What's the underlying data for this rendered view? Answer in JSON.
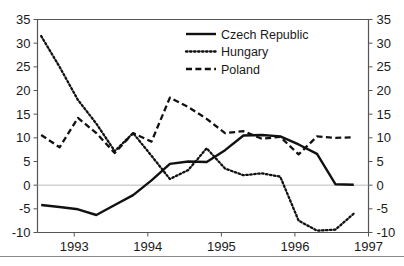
{
  "chart_data": {
    "type": "line",
    "title": "",
    "subtitle": "",
    "xlabel": "",
    "ylabel": "",
    "xlim": [
      1992.5,
      1997.0
    ],
    "ylim": [
      -10,
      35
    ],
    "yticks": [
      -10,
      -5,
      0,
      5,
      10,
      15,
      20,
      25,
      30,
      35
    ],
    "ytick_labels": [
      "-10",
      "-5",
      "0",
      "5",
      "10",
      "15",
      "20",
      "25",
      "30",
      "35"
    ],
    "xticks": [
      1993,
      1994,
      1995,
      1996,
      1997
    ],
    "xtick_labels": [
      "1993",
      "1994",
      "1995",
      "1996",
      "1997"
    ],
    "right_axis": true,
    "right_ytick_labels": [
      "-10",
      "-5",
      "0",
      "5",
      "10",
      "15",
      "20",
      "25",
      "30",
      "35"
    ],
    "grid": false,
    "zero_line": 0,
    "legend_position": "top-right",
    "series": [
      {
        "name": "Czech Republic",
        "style": "solid",
        "color": "#111111",
        "x": [
          1992.55,
          1992.8,
          1993.05,
          1993.3,
          1993.55,
          1993.8,
          1994.05,
          1994.3,
          1994.55,
          1994.8,
          1995.05,
          1995.3,
          1995.55,
          1995.8,
          1996.05,
          1996.3,
          1996.55,
          1996.8
        ],
        "values": [
          -4.2,
          -4.6,
          -5.1,
          -6.3,
          -4.2,
          -2.1,
          1.0,
          4.5,
          5.0,
          4.9,
          7.4,
          10.5,
          10.6,
          10.3,
          8.6,
          6.6,
          0.2,
          0.1
        ]
      },
      {
        "name": "Hungary",
        "style": "dotted",
        "color": "#111111",
        "x": [
          1992.55,
          1992.8,
          1993.05,
          1993.3,
          1993.55,
          1993.8,
          1994.05,
          1994.3,
          1994.55,
          1994.8,
          1995.05,
          1995.3,
          1995.55,
          1995.8,
          1996.05,
          1996.3,
          1996.55,
          1996.8
        ],
        "values": [
          31.5,
          25.0,
          18.0,
          13.0,
          7.2,
          11.0,
          6.2,
          1.3,
          3.2,
          7.8,
          3.5,
          2.1,
          2.5,
          1.8,
          -7.5,
          -9.6,
          -9.4,
          -6.0
        ]
      },
      {
        "name": "Poland",
        "style": "dashed",
        "color": "#111111",
        "x": [
          1992.55,
          1992.8,
          1993.05,
          1993.3,
          1993.55,
          1993.8,
          1994.05,
          1994.3,
          1994.55,
          1994.8,
          1995.05,
          1995.3,
          1995.55,
          1995.8,
          1996.05,
          1996.3,
          1996.55,
          1996.8
        ],
        "values": [
          10.6,
          8.0,
          14.2,
          11.0,
          6.8,
          11.0,
          9.2,
          18.5,
          16.5,
          14.0,
          11.0,
          11.4,
          9.8,
          10.2,
          6.5,
          10.3,
          10.0,
          10.1
        ]
      }
    ],
    "hungary_extra": {
      "note_x": [
        1995.8,
        1995.95,
        1996.05
      ],
      "note_values": [
        1.8,
        -3.0,
        -7.5
      ]
    },
    "poland_dip": {
      "x": [
        1995.95,
        1996.05,
        1996.2
      ],
      "values": [
        10.5,
        6.5,
        9.0
      ]
    }
  },
  "legend": {
    "items": [
      {
        "label": "Czech Republic",
        "style": "solid"
      },
      {
        "label": "Hungary",
        "style": "dotted"
      },
      {
        "label": "Poland",
        "style": "dashed"
      }
    ]
  }
}
